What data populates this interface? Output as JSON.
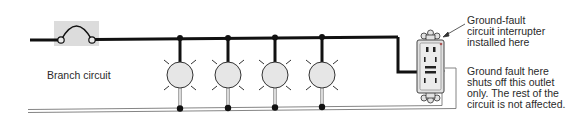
{
  "diagram": {
    "type": "wiring-schematic",
    "branch_label": "Branch circuit",
    "gfci_callout": "Ground-fault\ncircuit interrupter\ninstalled here",
    "fault_callout": "Ground fault here\nshuts off this outlet\nonly. The rest of the\ncircuit is not affected.",
    "cropped_text": "· · · · · · · f",
    "components": {
      "breaker": "circuit-breaker-symbol",
      "lamps": 4,
      "outlet": "gfci-receptacle"
    },
    "colors": {
      "hot_wire": "#111111",
      "neutral_wire": "#777777",
      "lamp_fill": "#e6e6e6",
      "breaker_bg": "#dcdcdc",
      "outlet_fill": "#e2e2e2"
    }
  }
}
